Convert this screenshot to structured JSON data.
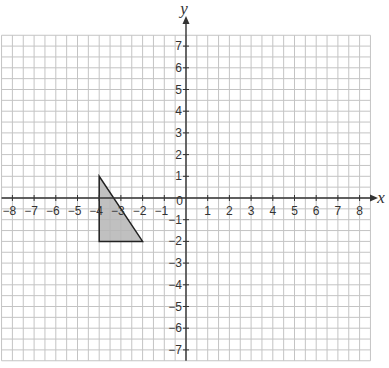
{
  "diagram": {
    "type": "coordinate-grid",
    "axes": {
      "x": {
        "label": "x",
        "min": -8,
        "max": 8,
        "ticks": [
          "-8",
          "-7",
          "-6",
          "-5",
          "-4",
          "-3",
          "-2",
          "-1",
          "1",
          "2",
          "3",
          "4",
          "5",
          "6",
          "7",
          "8"
        ]
      },
      "y": {
        "label": "y",
        "min": -7,
        "max": 7,
        "ticks": [
          "7",
          "6",
          "5",
          "4",
          "3",
          "2",
          "1",
          "-1",
          "-2",
          "-3",
          "-4",
          "-5",
          "-6",
          "-7"
        ]
      },
      "origin_label": "0"
    },
    "grid": {
      "minor_divisions_per_unit": 2,
      "x_range": [
        -8.5,
        8.5
      ],
      "y_range": [
        -7.5,
        7.5
      ]
    },
    "shapes": [
      {
        "name": "triangle",
        "vertices": [
          [
            -4,
            1
          ],
          [
            -4,
            -2
          ],
          [
            -2,
            -2
          ]
        ],
        "fill": "#b5b5b5",
        "stroke": "#222222"
      }
    ],
    "colors": {
      "grid": "#c4c4c4",
      "axis": "#333333"
    }
  },
  "chart_data": {
    "type": "scatter",
    "title": "",
    "xlabel": "x",
    "ylabel": "y",
    "xlim": [
      -8,
      8
    ],
    "ylim": [
      -7,
      7
    ],
    "grid": true,
    "polygons": [
      {
        "name": "triangle",
        "vertices": [
          [
            -4,
            1
          ],
          [
            -4,
            -2
          ],
          [
            -2,
            -2
          ]
        ]
      }
    ]
  }
}
